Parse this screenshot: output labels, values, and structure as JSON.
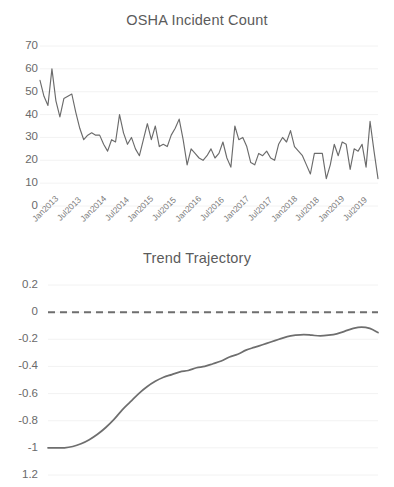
{
  "charts": {
    "incidents": {
      "title": "OSHA Incident Count",
      "type": "line",
      "xlabel": "",
      "ylabel": "",
      "ylim": [
        0,
        70
      ],
      "yticks": [
        "0",
        "10",
        "20",
        "30",
        "40",
        "50",
        "60",
        "70"
      ],
      "grid": true,
      "legend": "none",
      "line_color": "#6b6b6b",
      "xticklabels": [
        "Jan2013",
        "Jul2013",
        "Jan2014",
        "Jul2014",
        "Jan2015",
        "Jul2015",
        "Jan2016",
        "Jul2016",
        "Jan2017",
        "Jul2017",
        "Jan2018",
        "Jul2018",
        "Jan2019",
        "Jul2019"
      ],
      "x": [
        "Jan2013",
        "Feb2013",
        "Mar2013",
        "Apr2013",
        "May2013",
        "Jun2013",
        "Jul2013",
        "Aug2013",
        "Sep2013",
        "Oct2013",
        "Nov2013",
        "Dec2013",
        "Jan2014",
        "Feb2014",
        "Mar2014",
        "Apr2014",
        "May2014",
        "Jun2014",
        "Jul2014",
        "Aug2014",
        "Sep2014",
        "Oct2014",
        "Nov2014",
        "Dec2014",
        "Jan2015",
        "Feb2015",
        "Mar2015",
        "Apr2015",
        "May2015",
        "Jun2015",
        "Jul2015",
        "Aug2015",
        "Sep2015",
        "Oct2015",
        "Nov2015",
        "Dec2015",
        "Jan2016",
        "Feb2016",
        "Mar2016",
        "Apr2016",
        "May2016",
        "Jun2016",
        "Jul2016",
        "Aug2016",
        "Sep2016",
        "Oct2016",
        "Nov2016",
        "Dec2016",
        "Jan2017",
        "Feb2017",
        "Mar2017",
        "Apr2017",
        "May2017",
        "Jun2017",
        "Jul2017",
        "Aug2017",
        "Sep2017",
        "Oct2017",
        "Nov2017",
        "Dec2017",
        "Jan2018",
        "Feb2018",
        "Mar2018",
        "Apr2018",
        "May2018",
        "Jun2018",
        "Jul2018",
        "Aug2018",
        "Sep2018",
        "Oct2018",
        "Nov2018",
        "Dec2018",
        "Jan2019",
        "Feb2019",
        "Mar2019",
        "Apr2019",
        "May2019",
        "Jun2019",
        "Jul2019",
        "Aug2019",
        "Sep2019",
        "Oct2019",
        "Nov2019",
        "Dec2019"
      ],
      "values": [
        55,
        48,
        44,
        60,
        46,
        39,
        47,
        48,
        49,
        41,
        34,
        29,
        31,
        32,
        31,
        31,
        27,
        24,
        29,
        28,
        40,
        32,
        27,
        30,
        25,
        22,
        29,
        36,
        29,
        35,
        26,
        27,
        26,
        31,
        34,
        38,
        29,
        18,
        25,
        23,
        21,
        20,
        22,
        25,
        21,
        23,
        28,
        21,
        17,
        35,
        29,
        30,
        26,
        19,
        18,
        23,
        22,
        24,
        21,
        20,
        27,
        30,
        28,
        33,
        26,
        24,
        22,
        18,
        14,
        23,
        23,
        23,
        12,
        18,
        27,
        22,
        28,
        27,
        16,
        25,
        24,
        27,
        17,
        37,
        24,
        12
      ]
    },
    "trend": {
      "title": "Trend Trajectory",
      "type": "line",
      "xlabel": "",
      "ylabel": "",
      "ylim": [
        -1.2,
        0.2
      ],
      "yticks": [
        "0.2",
        "0",
        "-0.2",
        "-0.4",
        "-0.6",
        "-0.8",
        "-1",
        "1.2"
      ],
      "grid": true,
      "legend": "none",
      "line_color": "#6e6e6e",
      "reference_line": {
        "value": 0,
        "style": "dashed",
        "color": "#6e6e6e"
      },
      "x": [
        0,
        1,
        2,
        3,
        4,
        5,
        6,
        7,
        8,
        9,
        10,
        11,
        12,
        13,
        14,
        15,
        16,
        17,
        18,
        19,
        20,
        21,
        22,
        23,
        24,
        25,
        26,
        27,
        28,
        29,
        30,
        31,
        32,
        33,
        34,
        35,
        36,
        37,
        38,
        39,
        40
      ],
      "values": [
        -1.0,
        -1.0,
        -1.0,
        -0.99,
        -0.97,
        -0.94,
        -0.9,
        -0.85,
        -0.79,
        -0.72,
        -0.66,
        -0.6,
        -0.55,
        -0.51,
        -0.48,
        -0.46,
        -0.44,
        -0.43,
        -0.41,
        -0.4,
        -0.38,
        -0.36,
        -0.33,
        -0.31,
        -0.28,
        -0.26,
        -0.24,
        -0.22,
        -0.2,
        -0.18,
        -0.17,
        -0.165,
        -0.17,
        -0.175,
        -0.17,
        -0.16,
        -0.14,
        -0.12,
        -0.11,
        -0.12,
        -0.15
      ]
    }
  },
  "chart_data": [
    {
      "type": "line",
      "title": "OSHA Incident Count",
      "xlabel": "",
      "ylabel": "",
      "ylim": [
        0,
        70
      ],
      "yticks": [
        0,
        10,
        20,
        30,
        40,
        50,
        60,
        70
      ],
      "grid": true,
      "legend_position": "none",
      "categories": [
        "Jan2013",
        "Feb2013",
        "Mar2013",
        "Apr2013",
        "May2013",
        "Jun2013",
        "Jul2013",
        "Aug2013",
        "Sep2013",
        "Oct2013",
        "Nov2013",
        "Dec2013",
        "Jan2014",
        "Feb2014",
        "Mar2014",
        "Apr2014",
        "May2014",
        "Jun2014",
        "Jul2014",
        "Aug2014",
        "Sep2014",
        "Oct2014",
        "Nov2014",
        "Dec2014",
        "Jan2015",
        "Feb2015",
        "Mar2015",
        "Apr2015",
        "May2015",
        "Jun2015",
        "Jul2015",
        "Aug2015",
        "Sep2015",
        "Oct2015",
        "Nov2015",
        "Dec2015",
        "Jan2016",
        "Feb2016",
        "Mar2016",
        "Apr2016",
        "May2016",
        "Jun2016",
        "Jul2016",
        "Aug2016",
        "Sep2016",
        "Oct2016",
        "Nov2016",
        "Dec2016",
        "Jan2017",
        "Feb2017",
        "Mar2017",
        "Apr2017",
        "May2017",
        "Jun2017",
        "Jul2017",
        "Aug2017",
        "Sep2017",
        "Oct2017",
        "Nov2017",
        "Dec2017",
        "Jan2018",
        "Feb2018",
        "Mar2018",
        "Apr2018",
        "May2018",
        "Jun2018",
        "Jul2018",
        "Aug2018",
        "Sep2018",
        "Oct2018",
        "Nov2018",
        "Dec2018",
        "Jan2019",
        "Feb2019",
        "Mar2019",
        "Apr2019",
        "May2019",
        "Jun2019",
        "Jul2019",
        "Aug2019",
        "Sep2019",
        "Oct2019",
        "Nov2019",
        "Dec2019"
      ],
      "tick_labels": [
        "Jan2013",
        "Jul2013",
        "Jan2014",
        "Jul2014",
        "Jan2015",
        "Jul2015",
        "Jan2016",
        "Jul2016",
        "Jan2017",
        "Jul2017",
        "Jan2018",
        "Jul2018",
        "Jan2019",
        "Jul2019"
      ],
      "values": [
        55,
        48,
        44,
        60,
        46,
        39,
        47,
        48,
        49,
        41,
        34,
        29,
        31,
        32,
        31,
        31,
        27,
        24,
        29,
        28,
        40,
        32,
        27,
        30,
        25,
        22,
        29,
        36,
        29,
        35,
        26,
        27,
        26,
        31,
        34,
        38,
        29,
        18,
        25,
        23,
        21,
        20,
        22,
        25,
        21,
        23,
        28,
        21,
        17,
        35,
        29,
        30,
        26,
        19,
        18,
        23,
        22,
        24,
        21,
        20,
        27,
        30,
        28,
        33,
        26,
        24,
        22,
        18,
        14,
        23,
        23,
        23,
        12,
        18,
        27,
        22,
        28,
        27,
        16,
        25,
        24,
        27,
        17,
        37,
        24,
        12
      ]
    },
    {
      "type": "line",
      "title": "Trend Trajectory",
      "xlabel": "",
      "ylabel": "",
      "ylim": [
        -1.2,
        0.2
      ],
      "yticks": [
        0.2,
        0,
        -0.2,
        -0.4,
        -0.6,
        -0.8,
        -1,
        1.2
      ],
      "grid": true,
      "legend_position": "none",
      "annotations": [
        "dashed zero reference line"
      ],
      "x": [
        0,
        1,
        2,
        3,
        4,
        5,
        6,
        7,
        8,
        9,
        10,
        11,
        12,
        13,
        14,
        15,
        16,
        17,
        18,
        19,
        20,
        21,
        22,
        23,
        24,
        25,
        26,
        27,
        28,
        29,
        30,
        31,
        32,
        33,
        34,
        35,
        36,
        37,
        38,
        39,
        40
      ],
      "values": [
        -1.0,
        -1.0,
        -1.0,
        -0.99,
        -0.97,
        -0.94,
        -0.9,
        -0.85,
        -0.79,
        -0.72,
        -0.66,
        -0.6,
        -0.55,
        -0.51,
        -0.48,
        -0.46,
        -0.44,
        -0.43,
        -0.41,
        -0.4,
        -0.38,
        -0.36,
        -0.33,
        -0.31,
        -0.28,
        -0.26,
        -0.24,
        -0.22,
        -0.2,
        -0.18,
        -0.17,
        -0.165,
        -0.17,
        -0.175,
        -0.17,
        -0.16,
        -0.14,
        -0.12,
        -0.11,
        -0.12,
        -0.15
      ]
    }
  ]
}
